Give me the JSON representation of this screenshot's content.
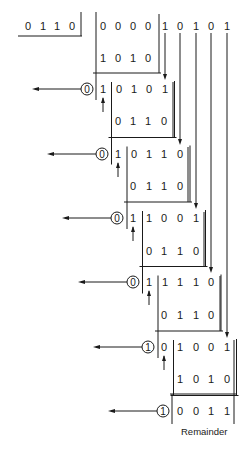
{
  "divisor": [
    "0",
    "1",
    "1",
    "0"
  ],
  "dividend": [
    "0",
    "0",
    "0",
    "0",
    "1",
    "0",
    "1",
    "0",
    "1"
  ],
  "steps": [
    {
      "quotient_bit": "1",
      "subtrahend": [
        "1",
        "0",
        "1",
        "0"
      ],
      "result": [
        "0",
        "1",
        "0",
        "1"
      ],
      "lead": "1"
    },
    {
      "quotient_bit": "0",
      "subtrahend": [
        "0",
        "1",
        "1",
        "0"
      ],
      "result": [
        "0",
        "1",
        "1",
        "0"
      ],
      "lead": "1"
    },
    {
      "quotient_bit": "0",
      "subtrahend": [
        "0",
        "1",
        "1",
        "0"
      ],
      "result": [
        "1",
        "0",
        "0",
        "1"
      ],
      "lead": "1"
    },
    {
      "quotient_bit": "0",
      "subtrahend": [
        "0",
        "1",
        "1",
        "0"
      ],
      "result": [
        "1",
        "1",
        "1",
        "0"
      ],
      "lead": "1"
    },
    {
      "quotient_bit": "0",
      "subtrahend": [
        "0",
        "1",
        "1",
        "0"
      ],
      "result": [
        "1",
        "0",
        "0",
        "1"
      ],
      "lead": "0"
    },
    {
      "quotient_bit": "1",
      "subtrahend": [
        "1",
        "0",
        "1",
        "0"
      ],
      "result": [
        "0",
        "0",
        "1",
        "1"
      ],
      "lead": ""
    }
  ],
  "rows": [
    {
      "circle": "",
      "cells": [
        "0",
        "0",
        "0",
        "0",
        "1",
        "0",
        "1",
        "0",
        "1"
      ]
    },
    {
      "cells": [
        "1",
        "0",
        "1",
        "0"
      ]
    },
    {
      "circle": "0",
      "cells": [
        "1",
        "0",
        "1",
        "0",
        "1"
      ]
    },
    {
      "cells": [
        "0",
        "1",
        "1",
        "0"
      ]
    },
    {
      "circle": "0",
      "cells": [
        "1",
        "0",
        "1",
        "1",
        "0"
      ]
    },
    {
      "cells": [
        "0",
        "1",
        "1",
        "0"
      ]
    },
    {
      "circle": "0",
      "cells": [
        "1",
        "1",
        "0",
        "0",
        "1"
      ]
    },
    {
      "cells": [
        "0",
        "1",
        "1",
        "0"
      ]
    },
    {
      "circle": "0",
      "cells": [
        "1",
        "1",
        "1",
        "1",
        "0"
      ]
    },
    {
      "cells": [
        "0",
        "1",
        "1",
        "0"
      ]
    },
    {
      "circle": "1",
      "cells": [
        "0",
        "1",
        "0",
        "0",
        "1"
      ]
    },
    {
      "cells": [
        "1",
        "0",
        "1",
        "0"
      ]
    },
    {
      "circle": "1",
      "cells": [
        "0",
        "0",
        "1",
        "1"
      ]
    }
  ],
  "remainder_label": "Remainder",
  "remainder": [
    "0",
    "0",
    "1",
    "1"
  ],
  "line_color": "#1a1a1a"
}
